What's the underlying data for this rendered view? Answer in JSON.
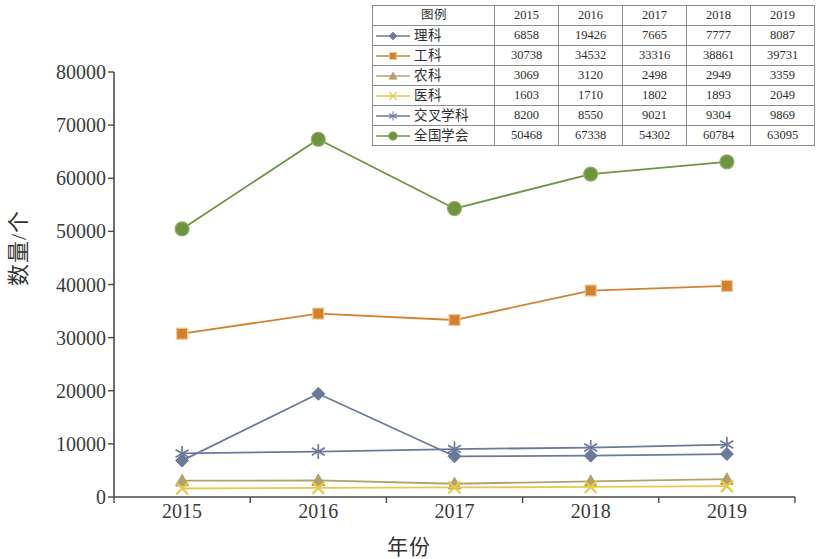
{
  "chart_data": {
    "type": "line",
    "title": "",
    "xlabel": "年份",
    "ylabel": "数量/个",
    "x": [
      2015,
      2016,
      2017,
      2018,
      2019
    ],
    "categories": [
      "2015",
      "2016",
      "2017",
      "2018",
      "2019"
    ],
    "ylim": [
      0,
      80000
    ],
    "ytick_values": [
      0,
      10000,
      20000,
      30000,
      40000,
      50000,
      60000,
      70000,
      80000
    ],
    "ytick_labels": [
      "0",
      "10000",
      "20000",
      "30000",
      "40000",
      "50000",
      "60000",
      "70000",
      "80000"
    ],
    "grid": false,
    "legend_position": "top-right-table",
    "series": [
      {
        "name": "理科",
        "marker": "diamond",
        "color": "#6b7a99",
        "values": [
          6858,
          19426,
          7665,
          7777,
          8087
        ]
      },
      {
        "name": "工科",
        "marker": "square",
        "color": "#d2822f",
        "values": [
          30738,
          34532,
          33316,
          38861,
          39731
        ]
      },
      {
        "name": "农科",
        "marker": "triangle",
        "color": "#b3a06a",
        "values": [
          3069,
          3120,
          2498,
          2949,
          3359
        ]
      },
      {
        "name": "医科",
        "marker": "x",
        "color": "#e8c84a",
        "values": [
          1603,
          1710,
          1802,
          1893,
          2049
        ]
      },
      {
        "name": "交叉学科",
        "marker": "asterisk",
        "color": "#6b7a99",
        "values": [
          8200,
          8550,
          9021,
          9304,
          9869
        ]
      },
      {
        "name": "全国学会",
        "marker": "circle",
        "color": "#6f9440",
        "values": [
          50468,
          67338,
          54302,
          60784,
          63095
        ]
      }
    ]
  },
  "legend_table": {
    "header": [
      "图例",
      "2015",
      "2016",
      "2017",
      "2018",
      "2019"
    ],
    "rows": [
      {
        "name": "理科",
        "values": [
          "6858",
          "19426",
          "7665",
          "7777",
          "8087"
        ]
      },
      {
        "name": "工科",
        "values": [
          "30738",
          "34532",
          "33316",
          "38861",
          "39731"
        ]
      },
      {
        "name": "农科",
        "values": [
          "3069",
          "3120",
          "2498",
          "2949",
          "3359"
        ]
      },
      {
        "name": "医科",
        "values": [
          "1603",
          "1710",
          "1802",
          "1893",
          "2049"
        ]
      },
      {
        "name": "交叉学科",
        "values": [
          "8200",
          "8550",
          "9021",
          "9304",
          "9869"
        ]
      },
      {
        "name": "全国学会",
        "values": [
          "50468",
          "67338",
          "54302",
          "60784",
          "63095"
        ]
      }
    ]
  },
  "axis": {
    "color": "#4a4a4a"
  }
}
